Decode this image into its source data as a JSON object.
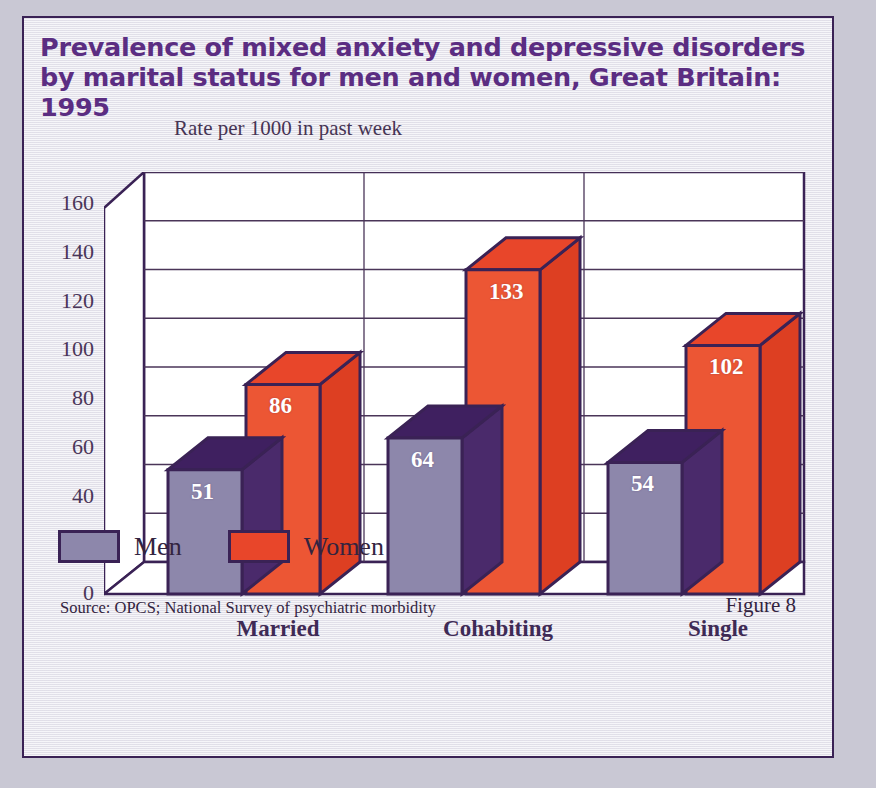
{
  "figure": {
    "title_line1": "Prevalence of mixed anxiety and depressive disorders",
    "title_line2": "by marital status for men and women, Great Britain: 1995",
    "subtitle": "Rate per 1000 in past week",
    "source": "Source: OPCS; National Survey of psychiatric morbidity",
    "figure_number": "Figure 8"
  },
  "legend": {
    "items": [
      {
        "label": "Men",
        "color": "#8d87ab"
      },
      {
        "label": "Women",
        "color": "#e8462a"
      }
    ]
  },
  "colors": {
    "title": "#5b2d82",
    "outline": "#3a2255",
    "men_front": "#8d87ab",
    "men_top": "#3f2060",
    "men_side": "#4a2a6b",
    "women_front": "#ec5634",
    "women_top": "#e8462a",
    "women_side": "#dd3f22",
    "plot_background": "#ffffff",
    "gridline": "#4a3558",
    "card_background": "#eceaf1",
    "page_background": "#c9c8d4"
  },
  "chart_data": {
    "type": "bar",
    "title": "Prevalence of mixed anxiety and depressive disorders by marital status for men and women, Great Britain: 1995",
    "subtitle": "Rate per 1000 in past week",
    "xlabel": "",
    "ylabel": "Rate per 1000 in past week",
    "categories": [
      "Married",
      "Cohabiting",
      "Single"
    ],
    "series": [
      {
        "name": "Men",
        "values": [
          51,
          64,
          54
        ]
      },
      {
        "name": "Women",
        "values": [
          86,
          133,
          102
        ]
      }
    ],
    "ylim": [
      0,
      160
    ],
    "yticks": [
      0,
      20,
      40,
      60,
      80,
      100,
      120,
      140,
      160
    ],
    "ytick_labels": [
      "0",
      "20",
      "40",
      "60",
      "80",
      "100",
      "120",
      "140",
      "160"
    ],
    "grid": true,
    "legend_position": "bottom-left",
    "three_d": true,
    "data_labels": true,
    "annotations": [
      "51",
      "86",
      "64",
      "133",
      "54",
      "102"
    ]
  }
}
